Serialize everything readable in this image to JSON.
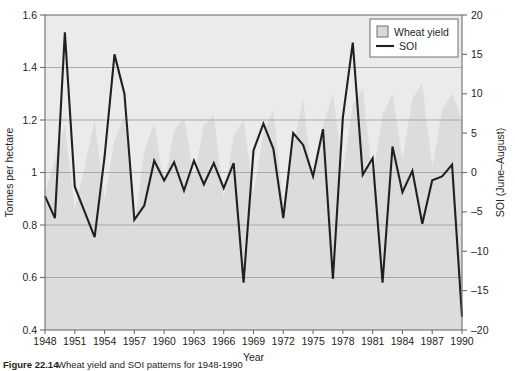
{
  "figure": {
    "caption_label": "Figure 22.14",
    "caption_text": "Wheat yield and SOI patterns for 1948-1990"
  },
  "legend": {
    "position": "top-right",
    "entries": [
      {
        "label": "Wheat yield",
        "marker": "filled-square",
        "color": "#d8d8d8"
      },
      {
        "label": "SOI",
        "marker": "line",
        "color": "#231f20"
      }
    ]
  },
  "colors": {
    "line": "#231f20",
    "area_fill": "#dcdcdc",
    "plot_background": "#ebebeb",
    "gridline": "#9b9b9b",
    "axis": "#6e6e6e",
    "text": "#231f20"
  },
  "chart_data": {
    "type": "line",
    "title": "",
    "subtitle": "",
    "xlabel": "Year",
    "ylabel": "Tonnes per hectare",
    "y2label": "SOI (June–August)",
    "grid": true,
    "legend_position": "top-right",
    "xlim": [
      1948,
      1990
    ],
    "xticks": [
      1948,
      1951,
      1954,
      1957,
      1960,
      1963,
      1966,
      1969,
      1972,
      1975,
      1978,
      1981,
      1984,
      1987,
      1990
    ],
    "xticklabels": [
      "1948",
      "1951",
      "1954",
      "1957",
      "1960",
      "1963",
      "1966",
      "1969",
      "1972",
      "1975",
      "1978",
      "1981",
      "1984",
      "1987",
      "1990"
    ],
    "ylim": [
      0.4,
      1.6
    ],
    "yticks": [
      0.4,
      0.6,
      0.8,
      1.0,
      1.2,
      1.4,
      1.6
    ],
    "yticklabels": [
      "0.4",
      "0.6",
      "0.8",
      "1",
      "1.2",
      "1.4",
      "1.6"
    ],
    "y2lim": [
      -20,
      20
    ],
    "y2ticks": [
      -20,
      -15,
      -10,
      -5,
      0,
      5,
      10,
      15,
      20
    ],
    "y2ticklabels": [
      "–20",
      "–15",
      "–10",
      "–5",
      "0",
      "5",
      "10",
      "15",
      "20"
    ],
    "x": [
      1948,
      1949,
      1950,
      1951,
      1952,
      1953,
      1954,
      1955,
      1956,
      1957,
      1958,
      1959,
      1960,
      1961,
      1962,
      1963,
      1964,
      1965,
      1966,
      1967,
      1968,
      1969,
      1970,
      1971,
      1972,
      1973,
      1974,
      1975,
      1976,
      1977,
      1978,
      1979,
      1980,
      1981,
      1982,
      1983,
      1984,
      1985,
      1986,
      1987,
      1988,
      1989,
      1990
    ],
    "series": [
      {
        "name": "Wheat yield",
        "type": "area",
        "axis": "left",
        "unit": "Tonnes per hectare",
        "values": [
          0.92,
          1.05,
          1.18,
          0.86,
          1.02,
          1.2,
          0.9,
          1.12,
          1.22,
          0.8,
          1.08,
          1.19,
          0.95,
          1.16,
          1.21,
          0.98,
          1.18,
          1.22,
          0.9,
          1.14,
          1.2,
          0.92,
          1.15,
          1.24,
          0.88,
          1.1,
          1.28,
          0.95,
          1.18,
          1.3,
          1.0,
          1.26,
          1.32,
          0.98,
          1.22,
          1.3,
          1.05,
          1.28,
          1.34,
          1.02,
          1.24,
          1.3,
          1.2
        ]
      },
      {
        "name": "SOI",
        "type": "line",
        "axis": "right",
        "unit": "SOI (June–August)",
        "values": [
          -3.0,
          -5.8,
          17.8,
          -1.8,
          -5.0,
          -8.2,
          2.0,
          15.0,
          10.0,
          -6.0,
          -4.2,
          1.5,
          -1.0,
          1.3,
          -2.3,
          1.5,
          -1.5,
          1.2,
          -2.0,
          1.2,
          -14.0,
          2.8,
          6.2,
          3.0,
          -5.8,
          5.0,
          3.5,
          -0.5,
          5.5,
          -13.5,
          7.0,
          16.5,
          -0.3,
          1.8,
          -14.0,
          3.3,
          -2.5,
          0.2,
          -6.5,
          -1.0,
          -0.5,
          1.0,
          -18.3
        ]
      }
    ]
  }
}
